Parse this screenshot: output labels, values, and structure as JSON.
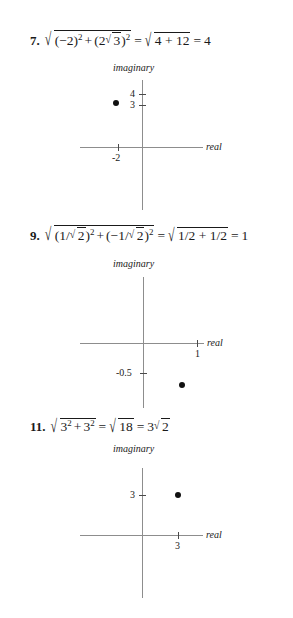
{
  "page": {
    "title": "Complex number modulus worked solutions",
    "axis_color": "#8d8d8d",
    "point_color": "#111111",
    "text_color": "#1a1a1a"
  },
  "problems": [
    {
      "number": "7.",
      "formula_plain": "sqrt((-2)^2 + (2 sqrt 3)^2) = sqrt(4 + 12) = 4",
      "parts": {
        "term1_base": "(−2)",
        "term1_exp": "2",
        "plus": "+",
        "term2_open": "(2",
        "term2_radicand": "3",
        "term2_close": ")",
        "term2_exp": "2",
        "equals": "=",
        "result_radicand": "4 + 12",
        "equals2": "=",
        "final": "4"
      },
      "plot": {
        "imaginary_label": "imaginary",
        "real_label": "real",
        "y_ticks": [
          {
            "label": "4",
            "value": 4
          },
          {
            "label": "3",
            "value": 3
          }
        ],
        "x_ticks": [
          {
            "label": "-2",
            "value": -2
          }
        ],
        "point": {
          "real": -2,
          "imaginary": 3.46
        }
      }
    },
    {
      "number": "9.",
      "formula_plain": "sqrt((1/sqrt2)^2 + (-1/sqrt2)^2) = sqrt(1/2 + 1/2) = 1",
      "parts": {
        "term1_open": "(1/",
        "term1_radicand": "2",
        "term1_close": ")",
        "term1_exp": "2",
        "plus": "+",
        "term2_open": "(−1/",
        "term2_radicand": "2",
        "term2_close": ")",
        "term2_exp": "2",
        "equals": "=",
        "result_radicand": "1/2 + 1/2",
        "equals2": "=",
        "final": "1"
      },
      "plot": {
        "imaginary_label": "imaginary",
        "real_label": "real",
        "y_ticks": [
          {
            "label": "-0.5",
            "value": -0.5
          }
        ],
        "x_ticks": [
          {
            "label": "1",
            "value": 1
          }
        ],
        "point": {
          "real": 0.707,
          "imaginary": -0.707
        }
      }
    },
    {
      "number": "11.",
      "formula_plain": "sqrt(3^2 + 3^2) = sqrt(18) = 3 sqrt 2",
      "parts": {
        "term1_base": "3",
        "term1_exp": "2",
        "plus": "+",
        "term2_base": "3",
        "term2_exp": "2",
        "equals": "=",
        "result_radicand": "18",
        "equals2": "=",
        "final_coeff": "3",
        "final_radicand": "2"
      },
      "plot": {
        "imaginary_label": "imaginary",
        "real_label": "real",
        "y_ticks": [
          {
            "label": "3",
            "value": 3
          }
        ],
        "x_ticks": [
          {
            "label": "3",
            "value": 3
          }
        ],
        "point": {
          "real": 3,
          "imaginary": 3
        }
      }
    }
  ],
  "glyphs": {
    "radical": "√"
  }
}
